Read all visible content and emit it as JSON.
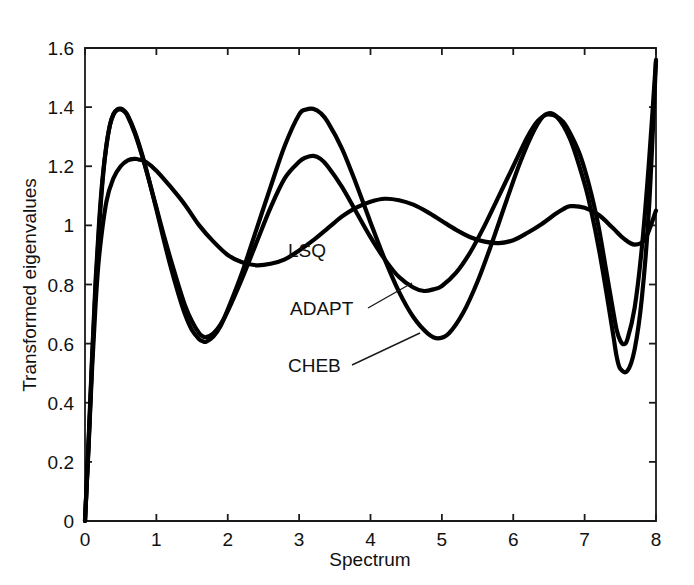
{
  "chart_data": {
    "type": "line",
    "title": "",
    "xlabel": "Spectrum",
    "ylabel": "Transformed eigenvalues",
    "xlim": [
      0,
      8
    ],
    "ylim": [
      0,
      1.6
    ],
    "grid": false,
    "legend_position": "inline-annotations",
    "xticks": [
      "0",
      "1",
      "2",
      "3",
      "4",
      "5",
      "6",
      "7",
      "8"
    ],
    "xtick_values": [
      0,
      1,
      2,
      3,
      4,
      5,
      6,
      7,
      8
    ],
    "yticks": [
      "0",
      "0.2",
      "0.4",
      "0.6",
      "0.8",
      "1",
      "1.2",
      "1.4",
      "1.6"
    ],
    "ytick_values": [
      0,
      0.2,
      0.4,
      0.6,
      0.8,
      1,
      1.2,
      1.4,
      1.6
    ],
    "line_color": "#000000",
    "axis_color": "#1a1a1a",
    "series": [
      {
        "name": "LSQ",
        "label": "LSQ",
        "x": [
          0.0,
          0.05,
          0.1,
          0.15,
          0.2,
          0.3,
          0.4,
          0.5,
          0.6,
          0.7,
          0.75,
          0.85,
          1.0,
          1.2,
          1.4,
          1.6,
          1.8,
          2.0,
          2.2,
          2.4,
          2.6,
          2.8,
          3.0,
          3.2,
          3.4,
          3.5,
          3.6,
          3.8,
          4.0,
          4.2,
          4.4,
          4.6,
          4.8,
          5.0,
          5.2,
          5.4,
          5.6,
          5.8,
          6.0,
          6.2,
          6.4,
          6.6,
          6.7,
          6.8,
          7.0,
          7.2,
          7.4,
          7.55,
          7.7,
          7.85,
          8.0
        ],
        "y": [
          0.0,
          0.25,
          0.52,
          0.74,
          0.9,
          1.08,
          1.16,
          1.2,
          1.22,
          1.225,
          1.223,
          1.215,
          1.185,
          1.13,
          1.07,
          1.0,
          0.945,
          0.9,
          0.875,
          0.865,
          0.87,
          0.885,
          0.915,
          0.95,
          0.99,
          1.01,
          1.03,
          1.06,
          1.08,
          1.09,
          1.085,
          1.07,
          1.045,
          1.015,
          0.985,
          0.96,
          0.945,
          0.94,
          0.95,
          0.975,
          1.005,
          1.04,
          1.055,
          1.065,
          1.06,
          1.035,
          0.99,
          0.955,
          0.935,
          0.955,
          1.05
        ]
      },
      {
        "name": "ADAPT",
        "label": "ADAPT",
        "x": [
          0.0,
          0.05,
          0.1,
          0.15,
          0.2,
          0.25,
          0.3,
          0.35,
          0.4,
          0.45,
          0.5,
          0.55,
          0.6,
          0.7,
          0.8,
          0.9,
          1.0,
          1.1,
          1.2,
          1.3,
          1.4,
          1.5,
          1.6,
          1.65,
          1.7,
          1.8,
          1.9,
          2.0,
          2.2,
          2.4,
          2.6,
          2.8,
          3.0,
          3.1,
          3.2,
          3.3,
          3.4,
          3.6,
          3.8,
          4.0,
          4.2,
          4.4,
          4.6,
          4.75,
          4.9,
          5.0,
          5.2,
          5.4,
          5.6,
          5.8,
          6.0,
          6.2,
          6.35,
          6.5,
          6.7,
          6.9,
          7.0,
          7.1,
          7.2,
          7.3,
          7.4,
          7.45,
          7.5,
          7.55,
          7.6,
          7.7,
          7.8,
          7.9,
          8.0
        ],
        "y": [
          0.0,
          0.27,
          0.56,
          0.82,
          1.02,
          1.17,
          1.27,
          1.34,
          1.375,
          1.39,
          1.392,
          1.385,
          1.368,
          1.31,
          1.235,
          1.15,
          1.06,
          0.97,
          0.885,
          0.805,
          0.73,
          0.675,
          0.635,
          0.625,
          0.622,
          0.635,
          0.665,
          0.71,
          0.82,
          0.94,
          1.06,
          1.16,
          1.215,
          1.23,
          1.235,
          1.225,
          1.2,
          1.13,
          1.045,
          0.96,
          0.885,
          0.825,
          0.79,
          0.778,
          0.785,
          0.795,
          0.84,
          0.91,
          1.0,
          1.1,
          1.2,
          1.3,
          1.355,
          1.375,
          1.35,
          1.26,
          1.19,
          1.1,
          0.99,
          0.85,
          0.71,
          0.645,
          0.61,
          0.598,
          0.615,
          0.72,
          0.92,
          1.21,
          1.56
        ]
      },
      {
        "name": "CHEB",
        "label": "CHEB",
        "x": [
          0.0,
          0.05,
          0.1,
          0.15,
          0.2,
          0.25,
          0.3,
          0.35,
          0.4,
          0.45,
          0.5,
          0.55,
          0.6,
          0.7,
          0.8,
          0.9,
          1.0,
          1.1,
          1.2,
          1.3,
          1.4,
          1.5,
          1.6,
          1.65,
          1.7,
          1.8,
          1.9,
          2.0,
          2.2,
          2.4,
          2.6,
          2.8,
          3.0,
          3.1,
          3.2,
          3.3,
          3.4,
          3.6,
          3.8,
          4.0,
          4.2,
          4.4,
          4.6,
          4.8,
          4.95,
          5.1,
          5.3,
          5.5,
          5.7,
          5.9,
          6.1,
          6.3,
          6.45,
          6.6,
          6.8,
          7.0,
          7.1,
          7.2,
          7.3,
          7.4,
          7.45,
          7.5,
          7.6,
          7.7,
          7.8,
          7.9,
          8.0
        ],
        "y": [
          0.0,
          0.26,
          0.545,
          0.8,
          1.0,
          1.16,
          1.27,
          1.34,
          1.378,
          1.392,
          1.395,
          1.388,
          1.372,
          1.315,
          1.24,
          1.15,
          1.055,
          0.955,
          0.86,
          0.775,
          0.7,
          0.645,
          0.615,
          0.608,
          0.607,
          0.625,
          0.66,
          0.715,
          0.84,
          0.985,
          1.13,
          1.27,
          1.375,
          1.392,
          1.394,
          1.38,
          1.35,
          1.26,
          1.14,
          1.01,
          0.885,
          0.775,
          0.69,
          0.635,
          0.618,
          0.635,
          0.705,
          0.81,
          0.94,
          1.08,
          1.215,
          1.325,
          1.375,
          1.37,
          1.29,
          1.14,
          1.04,
          0.92,
          0.78,
          0.63,
          0.555,
          0.515,
          0.508,
          0.58,
          0.75,
          1.05,
          1.555
        ]
      }
    ],
    "annotations": [
      {
        "text": "LSQ",
        "x_px": 288,
        "y_px": 257,
        "leader": null
      },
      {
        "text": "ADAPT",
        "x_px": 290,
        "y_px": 315,
        "leader": {
          "x1": 368,
          "y1": 308,
          "x2": 412,
          "y2": 283
        }
      },
      {
        "text": "CHEB",
        "x_px": 288,
        "y_px": 372,
        "leader": {
          "x1": 352,
          "y1": 365,
          "x2": 420,
          "y2": 333
        }
      }
    ]
  },
  "figure": {
    "background_color": "#ffffff"
  }
}
